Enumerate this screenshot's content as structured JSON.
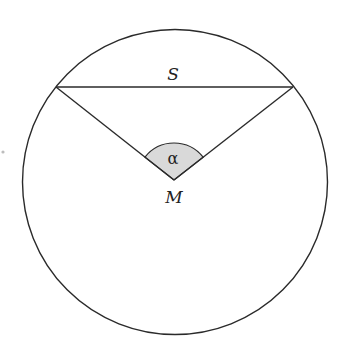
{
  "diagram": {
    "type": "circle-chord-central-angle",
    "labels": {
      "chord": "S",
      "center": "M",
      "angle": "α"
    },
    "colors": {
      "stroke": "#2a2a2a",
      "angle_fill": "#d9d9d9",
      "background": "#ffffff"
    }
  }
}
